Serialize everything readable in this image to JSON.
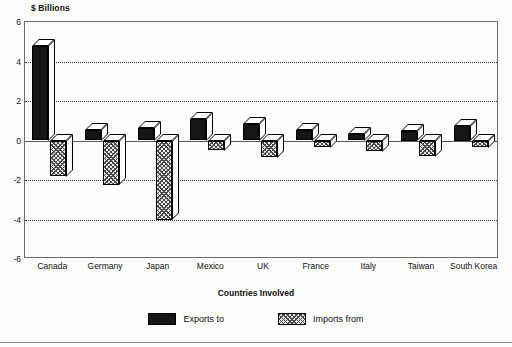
{
  "chart_data": {
    "type": "bar",
    "title": "",
    "subtitle": "",
    "xlabel": "Countries Involved",
    "ylabel": "$ Billions",
    "unit_caption": "$ Billions",
    "ylim": [
      -6,
      6
    ],
    "yticks": [
      6,
      4,
      2,
      0,
      -2,
      -4,
      -6
    ],
    "ytick_labels": [
      "6",
      "4",
      "2",
      "0",
      "-2",
      "-4",
      "-6"
    ],
    "grid": true,
    "grid_style": "dotted-horizontal",
    "zero_line": true,
    "legend_position": "bottom",
    "style": "3d-grouped-bar",
    "categories": [
      "Canada",
      "Germany",
      "Japan",
      "Mexico",
      "UK",
      "France",
      "Italy",
      "Taiwan",
      "South Korea"
    ],
    "series": [
      {
        "name": "Exports to",
        "color": "#151515",
        "fill": "solid-black",
        "values": [
          4.8,
          0.55,
          0.65,
          1.1,
          0.85,
          0.55,
          0.35,
          0.5,
          0.75
        ]
      },
      {
        "name": "Imports from",
        "color": "#e8e8e8",
        "fill": "cross-hatch",
        "values": [
          -1.8,
          -2.25,
          -4.0,
          -0.5,
          -0.85,
          -0.35,
          -0.55,
          -0.8,
          -0.35
        ]
      }
    ]
  },
  "legend": {
    "items": [
      {
        "label": "Exports to",
        "swatch": "solid-black-swatch"
      },
      {
        "label": "Imports from",
        "swatch": "hatched-swatch"
      }
    ]
  },
  "axis": {
    "x_title": "Countries Involved",
    "y_unit": "$ Billions"
  }
}
